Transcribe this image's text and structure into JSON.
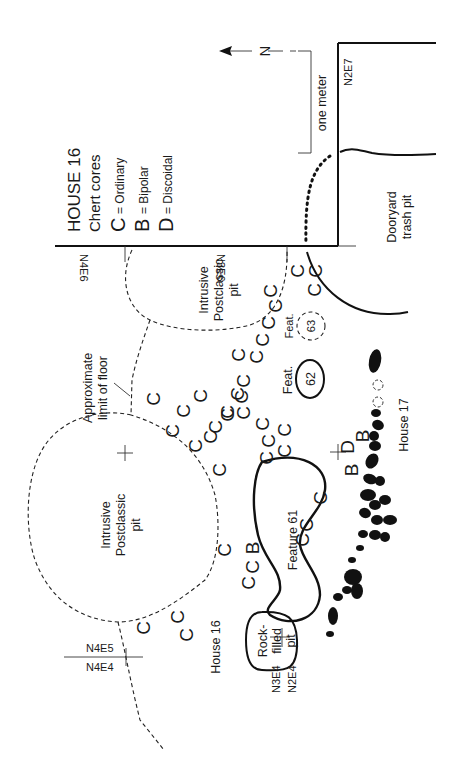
{
  "figure": {
    "title": "HOUSE 16",
    "subtitle": "Chert cores",
    "orientation": "rotated 90 degrees counter-clockwise",
    "north_arrow_label": "N",
    "scale_bar_label": "one meter"
  },
  "legend": [
    {
      "key": "C",
      "meaning": "= Ordinary"
    },
    {
      "key": "B",
      "meaning": "= Bipolar"
    },
    {
      "key": "D",
      "meaning": "= Discoidal"
    }
  ],
  "grid_labels": {
    "n2e7": "N2E7",
    "n4e6": "N4E6",
    "n3e6": "N3E6",
    "n4e5": "N4E5",
    "n4e4": "N4E4",
    "n3e4": "N3E4",
    "n2e4": "N2E4"
  },
  "features": {
    "intrusive_pit_small": [
      "Intrusive",
      "Postclassic",
      "pit"
    ],
    "intrusive_pit_large": [
      "Intrusive",
      "Postclassic",
      "pit"
    ],
    "floor_limit": [
      "Approximate",
      "limit of floor"
    ],
    "feature_61": "Feature 61",
    "feature_62": {
      "prefix": "Feat.",
      "number": "62"
    },
    "feature_63": {
      "prefix": "Feat.",
      "number": "63"
    },
    "rock_filled_pit": [
      "Rock-",
      "filled",
      "pit"
    ],
    "dooryard_trash_pit": [
      "Dooryard",
      "trash pit"
    ],
    "house_16": "House 16",
    "house_17": "House 17"
  },
  "cores": {
    "ordinary": "C",
    "bipolar": "B",
    "discoidal": "D",
    "counts": {
      "C": 40,
      "B": 4,
      "D": 1
    }
  }
}
